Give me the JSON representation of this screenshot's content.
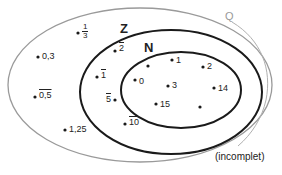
{
  "sets": {
    "Q": {
      "label": "Q",
      "color": "#9a9a9a"
    },
    "Z": {
      "label": "Z",
      "color": "#1a1a1a"
    },
    "N": {
      "label": "N",
      "color": "#1a1a1a"
    }
  },
  "elements": {
    "one_third": {
      "numerator": "1",
      "denominator": "3",
      "set": "Q"
    },
    "zero_three": {
      "label": "0,3",
      "set": "Q"
    },
    "zero_five_repeating": {
      "label": "0,5",
      "overline": true,
      "set": "Q"
    },
    "one_twenty_five": {
      "label": "1,25",
      "set": "Q"
    },
    "neg_two": {
      "label": "2",
      "overline": true,
      "set": "Z"
    },
    "neg_one": {
      "label": "1",
      "overline": true,
      "set": "Z"
    },
    "neg_five": {
      "label": "5",
      "overline": true,
      "set": "Z"
    },
    "neg_ten": {
      "label": "10",
      "overline": true,
      "set": "Z"
    },
    "zero": {
      "label": "0",
      "set": "N"
    },
    "one": {
      "label": "1",
      "set": "N"
    },
    "two": {
      "label": "2",
      "set": "N"
    },
    "three": {
      "label": "3",
      "set": "N"
    },
    "fourteen": {
      "label": "14",
      "set": "N"
    },
    "fifteen": {
      "label": "15",
      "set": "N"
    }
  },
  "note": "(incomplet)"
}
